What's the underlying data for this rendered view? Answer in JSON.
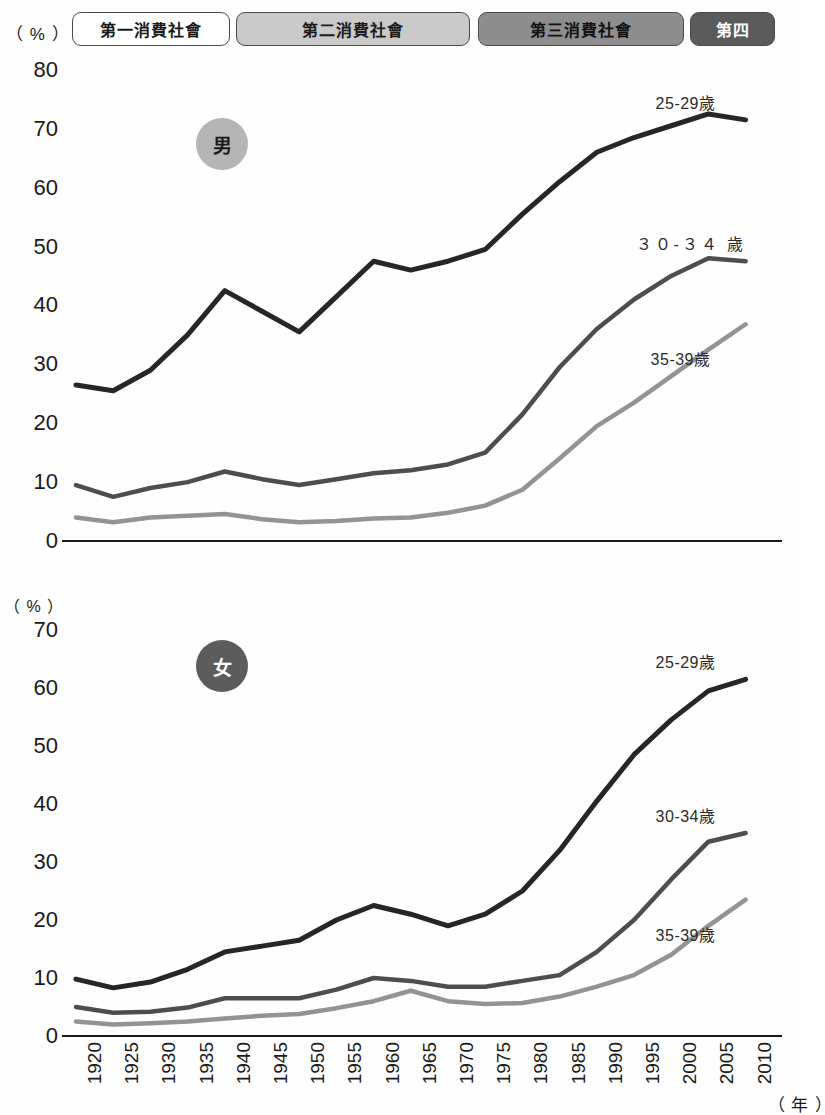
{
  "era_strip": {
    "unit_label": "（ % ）",
    "bands": [
      {
        "label": "第一消費社會",
        "color": "#ffffff",
        "text_color": "#1a1a1a",
        "left": 72,
        "width": 158
      },
      {
        "label": "第二消費社會",
        "color": "#c9c9c9",
        "text_color": "#1a1a1a",
        "left": 236,
        "width": 234
      },
      {
        "label": "第三消費社會",
        "color": "#8e8e8e",
        "text_color": "#111111",
        "left": 478,
        "width": 206
      },
      {
        "label": "第四",
        "color": "#5a5a5a",
        "text_color": "#ffffff",
        "left": 690,
        "width": 85
      }
    ]
  },
  "male_panel": {
    "unit_label": "（ % ）",
    "badge": "男",
    "yticks": [
      "80",
      "70",
      "60",
      "50",
      "40",
      "30",
      "20",
      "10",
      "0"
    ],
    "series_labels": [
      "25-29歲",
      "３０-３４ 歲",
      "35-39歲"
    ]
  },
  "female_panel": {
    "unit_label": "（ % ）",
    "badge": "女",
    "yticks": [
      "70",
      "60",
      "50",
      "40",
      "30",
      "20",
      "10",
      "0"
    ],
    "series_labels": [
      "25-29歲",
      "30-34歲",
      "35-39歲"
    ]
  },
  "xaxis": {
    "unit_label": "（ 年 ）",
    "ticks": [
      "1920",
      "1925",
      "1930",
      "1935",
      "1940",
      "1945",
      "1950",
      "1955",
      "1960",
      "1965",
      "1970",
      "1975",
      "1980",
      "1985",
      "1990",
      "1995",
      "2000",
      "2005",
      "2010"
    ]
  },
  "colors": {
    "series_25_29": "#262626",
    "series_30_34": "#4d4d4d",
    "series_35_39": "#939393",
    "axis": "#1a1a1a"
  },
  "chart_data": [
    {
      "type": "line",
      "title": "男",
      "xlabel": "（ 年 ）",
      "ylabel": "（ % ）",
      "ylim": [
        0,
        80
      ],
      "xlim": [
        1920,
        2010
      ],
      "grid": false,
      "legend": "inline-end-of-line",
      "x": [
        1920,
        1925,
        1930,
        1935,
        1940,
        1945,
        1950,
        1955,
        1960,
        1965,
        1970,
        1975,
        1980,
        1985,
        1990,
        1995,
        2000,
        2005,
        2010
      ],
      "series": [
        {
          "name": "25-29歲",
          "color": "#262626",
          "values": [
            26.5,
            25.5,
            29.0,
            35.0,
            42.5,
            39.0,
            35.5,
            41.5,
            47.5,
            46.0,
            47.5,
            49.5,
            55.5,
            61.0,
            66.0,
            68.5,
            70.5,
            72.5,
            71.5
          ]
        },
        {
          "name": "３０-３４ 歲",
          "color": "#4d4d4d",
          "values": [
            9.5,
            7.5,
            9.0,
            10.0,
            11.8,
            10.5,
            9.5,
            10.5,
            11.5,
            12.0,
            13.0,
            15.0,
            21.5,
            29.5,
            36.0,
            41.0,
            45.0,
            48.0,
            47.5
          ]
        },
        {
          "name": "35-39歲",
          "color": "#939393",
          "values": [
            4.0,
            3.2,
            4.0,
            4.3,
            4.6,
            3.7,
            3.2,
            3.4,
            3.8,
            4.0,
            4.8,
            6.0,
            8.7,
            14.0,
            19.5,
            23.5,
            28.0,
            32.5,
            36.8
          ]
        }
      ]
    },
    {
      "type": "line",
      "title": "女",
      "xlabel": "（ 年 ）",
      "ylabel": "（ % ）",
      "ylim": [
        0,
        70
      ],
      "xlim": [
        1920,
        2010
      ],
      "grid": false,
      "legend": "inline-end-of-line",
      "x": [
        1920,
        1925,
        1930,
        1935,
        1940,
        1945,
        1950,
        1955,
        1960,
        1965,
        1970,
        1975,
        1980,
        1985,
        1990,
        1995,
        2000,
        2005,
        2010
      ],
      "series": [
        {
          "name": "25-29歲",
          "color": "#262626",
          "values": [
            9.8,
            8.3,
            9.3,
            11.5,
            14.5,
            15.5,
            16.5,
            20.0,
            22.5,
            21.0,
            19.0,
            21.0,
            25.0,
            32.0,
            40.5,
            48.5,
            54.5,
            59.5,
            61.5
          ]
        },
        {
          "name": "30-34歲",
          "color": "#4d4d4d",
          "values": [
            5.0,
            4.0,
            4.2,
            4.9,
            6.5,
            6.5,
            6.5,
            8.0,
            10.0,
            9.5,
            8.5,
            8.5,
            9.5,
            10.5,
            14.5,
            20.0,
            27.0,
            33.5,
            35.0
          ]
        },
        {
          "name": "35-39歲",
          "color": "#939393",
          "values": [
            2.5,
            2.0,
            2.2,
            2.5,
            3.0,
            3.5,
            3.8,
            4.8,
            6.0,
            7.8,
            6.0,
            5.5,
            5.7,
            6.8,
            8.5,
            10.5,
            14.0,
            19.0,
            23.5
          ]
        }
      ]
    }
  ]
}
